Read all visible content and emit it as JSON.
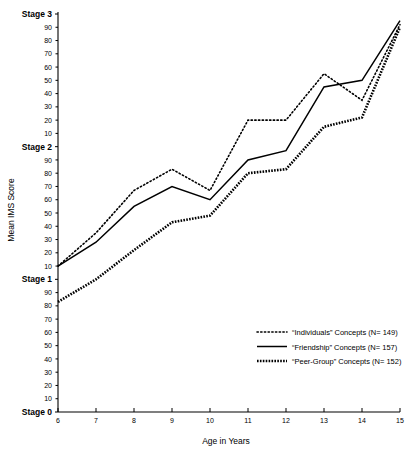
{
  "chart_data": {
    "type": "line",
    "title": "",
    "xlabel": "Age in Years",
    "ylabel": "Mean IMS Score",
    "xlim": [
      6,
      15
    ],
    "ylim": [
      0,
      300
    ],
    "grid": false,
    "legend_position": "lower-right",
    "x": [
      6,
      7,
      8,
      9,
      10,
      11,
      12,
      13,
      14,
      15
    ],
    "x_tick_labels": [
      "6",
      "7",
      "8",
      "9",
      "10",
      "11",
      "12",
      "13",
      "14",
      "15"
    ],
    "y_stage_labels": [
      "Stage 0",
      "Stage 1",
      "Stage 2",
      "Stage 3"
    ],
    "y_minor_tick_labels": [
      "10",
      "20",
      "30",
      "40",
      "50",
      "60",
      "70",
      "80",
      "90"
    ],
    "series": [
      {
        "name": "“Individuals” Concepts",
        "n_label": "(N= 149)",
        "style": "fine-dotted",
        "values": [
          110,
          135,
          167,
          183,
          167,
          220,
          220,
          255,
          235,
          292
        ]
      },
      {
        "name": "“Friendship” Concepts",
        "n_label": "(N= 157)",
        "style": "solid",
        "values": [
          110,
          128,
          155,
          170,
          160,
          190,
          197,
          245,
          250,
          295
        ]
      },
      {
        "name": "“Peer-Group” Concepts",
        "n_label": "(N= 152)",
        "style": "heavy-dotted",
        "values": [
          83,
          100,
          122,
          143,
          148,
          180,
          183,
          215,
          222,
          290
        ]
      }
    ]
  },
  "legend": {
    "entries": [
      {
        "label": "“Individuals” Concepts (N= 149)"
      },
      {
        "label": "“Friendship” Concepts (N= 157)"
      },
      {
        "label": "“Peer-Group” Concepts (N= 152)"
      }
    ]
  },
  "axes": {
    "x_title": "Age in Years",
    "y_title": "Mean IMS Score"
  }
}
